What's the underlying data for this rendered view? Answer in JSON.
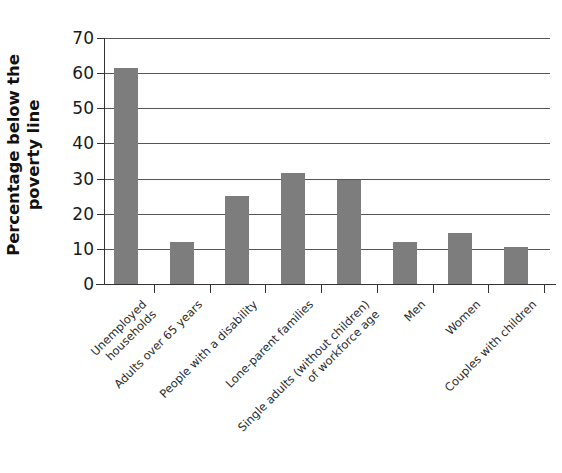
{
  "chart_data": {
    "type": "bar",
    "title": "",
    "xlabel": "",
    "ylabel": "Percentage below the poverty line",
    "ylabel_lines": [
      "Percentage below the",
      "poverty line"
    ],
    "categories": [
      "Unemployed\nhouseholds",
      "Adults over 65 years",
      "People with a disability",
      "Lone-parent families",
      "Single adults (without children)\nof workforce age",
      "Men",
      "Women",
      "Couples with children"
    ],
    "values": [
      61.5,
      12.0,
      25.0,
      31.5,
      29.5,
      12.0,
      14.5,
      10.5
    ],
    "ylim": [
      0,
      70
    ],
    "yticks": [
      0,
      10,
      20,
      30,
      40,
      50,
      60,
      70
    ],
    "ytick_labels": [
      "0",
      "10",
      "20",
      "30",
      "40",
      "50",
      "60",
      "70"
    ],
    "grid": true,
    "grid_axis": "y",
    "legend": false,
    "legend_position": "none",
    "bar_color": "#7d7d7d",
    "axis_color": "#333333",
    "grid_color": "#555555",
    "background": "#ffffff"
  }
}
